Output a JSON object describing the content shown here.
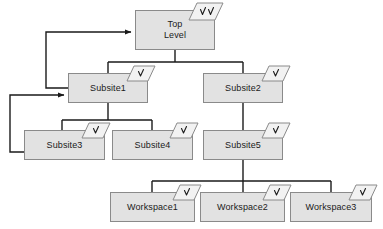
{
  "diagram": {
    "type": "tree-diagram",
    "canvas": {
      "width": 383,
      "height": 229
    },
    "style": {
      "node_fill": "#e2e2e2",
      "node_border": "#8a8a8a",
      "edge_color": "#1a1a1a",
      "badge_fill": "#f2f2f2",
      "badge_border": "#8a8a8a",
      "text_color": "#1a1a1a",
      "background": "#ffffff"
    },
    "nodes": [
      {
        "id": "top-level",
        "label": "Top\nLevel",
        "x": 135,
        "y": 10,
        "w": 80,
        "h": 40,
        "badge": {
          "icon": "double-check-badge-icon",
          "checks": 2,
          "x": 188,
          "y": 2,
          "w": 36,
          "h": 19
        }
      },
      {
        "id": "subsite1",
        "label": "Subsite1",
        "x": 68,
        "y": 73,
        "w": 80,
        "h": 30,
        "badge": {
          "icon": "check-badge-icon",
          "checks": 1,
          "x": 126,
          "y": 65,
          "w": 30,
          "h": 17
        }
      },
      {
        "id": "subsite2",
        "label": "Subsite2",
        "x": 203,
        "y": 73,
        "w": 80,
        "h": 30,
        "badge": {
          "icon": "check-badge-icon",
          "checks": 1,
          "x": 261,
          "y": 65,
          "w": 30,
          "h": 17
        }
      },
      {
        "id": "subsite3",
        "label": "Subsite3",
        "x": 24,
        "y": 130,
        "w": 81,
        "h": 30,
        "badge": {
          "icon": "check-badge-icon",
          "checks": 1,
          "x": 81,
          "y": 122,
          "w": 30,
          "h": 17
        }
      },
      {
        "id": "subsite4",
        "label": "Subsite4",
        "x": 112,
        "y": 130,
        "w": 81,
        "h": 30,
        "badge": {
          "icon": "check-badge-icon",
          "checks": 1,
          "x": 169,
          "y": 122,
          "w": 30,
          "h": 17
        }
      },
      {
        "id": "subsite5",
        "label": "Subsite5",
        "x": 203,
        "y": 130,
        "w": 80,
        "h": 30,
        "badge": {
          "icon": "check-badge-icon",
          "checks": 1,
          "x": 261,
          "y": 122,
          "w": 30,
          "h": 17
        }
      },
      {
        "id": "workspace1",
        "label": "Workspace1",
        "x": 110,
        "y": 192,
        "w": 85,
        "h": 30,
        "badge": {
          "icon": "check-badge-icon",
          "checks": 1,
          "x": 172,
          "y": 184,
          "w": 30,
          "h": 17
        }
      },
      {
        "id": "workspace2",
        "label": "Workspace2",
        "x": 200,
        "y": 192,
        "w": 85,
        "h": 30,
        "badge": {
          "icon": "check-badge-icon",
          "checks": 1,
          "x": 262,
          "y": 184,
          "w": 30,
          "h": 17
        }
      },
      {
        "id": "workspace3",
        "label": "Workspace3",
        "x": 290,
        "y": 192,
        "w": 82,
        "h": 30,
        "badge": {
          "icon": "check-badge-icon",
          "checks": 1,
          "x": 348,
          "y": 184,
          "w": 30,
          "h": 17
        }
      }
    ],
    "edges": [
      {
        "id": "edge-top-to-subsites",
        "from": "top-level",
        "to": "subsite1,subsite2",
        "kind": "tree",
        "arrow": false
      },
      {
        "id": "edge-subsite1-to-children",
        "from": "subsite1",
        "to": "subsite3,subsite4",
        "kind": "tree",
        "arrow": false
      },
      {
        "id": "edge-subsite2-to-subsite5",
        "from": "subsite2",
        "to": "subsite5",
        "kind": "tree",
        "arrow": false
      },
      {
        "id": "edge-subsite5-to-workspaces",
        "from": "subsite5",
        "to": "workspace1,workspace2,workspace3",
        "kind": "tree",
        "arrow": false
      },
      {
        "id": "edge-subsite1-back-to-top",
        "from": "subsite1",
        "to": "top-level",
        "kind": "feedback",
        "arrow": true
      },
      {
        "id": "edge-subsite3-back-to-subsite1",
        "from": "subsite3",
        "to": "subsite1",
        "kind": "feedback",
        "arrow": true
      }
    ]
  }
}
